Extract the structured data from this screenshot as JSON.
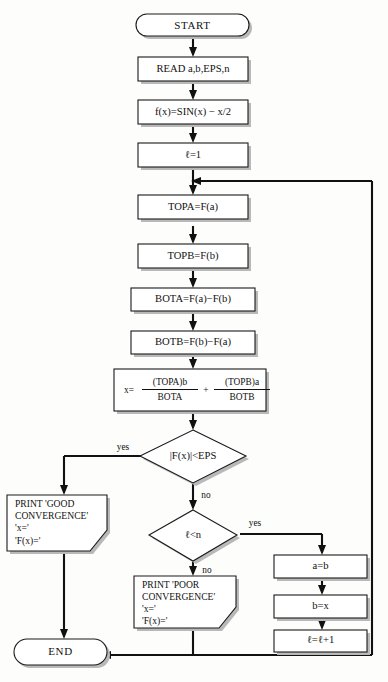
{
  "diagram": {
    "background_color": "#fdfdfb",
    "line_color": "#111111",
    "node_fill": "#ffffff"
  },
  "nodes": {
    "start": {
      "label": "START",
      "shape": "terminator"
    },
    "read": {
      "label": "READ a,b,EPS,n",
      "shape": "process"
    },
    "fx_def": {
      "label": "f(x)=SIN(x) − x/2",
      "shape": "process"
    },
    "l_init": {
      "label": "ℓ=1",
      "shape": "process"
    },
    "topa": {
      "label": "TOPA=F(a)",
      "shape": "process"
    },
    "topb": {
      "label": "TOPB=F(b)",
      "shape": "process"
    },
    "bota": {
      "label": "BOTA=F(a)−F(b)",
      "shape": "process"
    },
    "botb": {
      "label": "BOTB=F(b)−F(a)",
      "shape": "process"
    },
    "formula": {
      "shape": "process",
      "lead": "x=",
      "num1": "(TOPA)b",
      "den1": "BOTA",
      "operator": "+",
      "num2": "(TOPB)a",
      "den2": "BOTB",
      "plain": "x=(TOPA)b/BOTA + (TOPB)a/BOTB"
    },
    "decision_eps": {
      "label": "|F(x)|<EPS",
      "shape": "decision"
    },
    "decision_n": {
      "label": "ℓ<n",
      "shape": "decision"
    },
    "print_good": {
      "shape": "output",
      "lines": [
        "PRINT 'GOOD",
        "CONVERGENCE'",
        "'x='",
        "'F(x)='"
      ]
    },
    "print_poor": {
      "shape": "output",
      "lines": [
        "PRINT 'POOR",
        "CONVERGENCE'",
        "'x='",
        "'F(x)='"
      ]
    },
    "assign_a": {
      "label": "a=b",
      "shape": "process"
    },
    "assign_b": {
      "label": "b=x",
      "shape": "process"
    },
    "increment": {
      "label": "ℓ=ℓ+1",
      "shape": "process"
    },
    "end": {
      "label": "END",
      "shape": "terminator"
    }
  },
  "branch_labels": {
    "eps_yes": "yes",
    "eps_no": "no",
    "n_yes": "yes",
    "n_no": "no"
  }
}
